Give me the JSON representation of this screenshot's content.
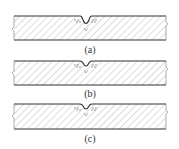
{
  "figure": {
    "panels": [
      {
        "id": "a",
        "label": "(a)",
        "notch": "rounded groove with dashed interface"
      },
      {
        "id": "b",
        "label": "(b)",
        "notch": "shallow rounded groove with dashed interface"
      },
      {
        "id": "c",
        "label": "(c)",
        "notch": "shallow rounded groove with dashed interface"
      }
    ],
    "colors": {
      "line": "#333333",
      "hatch": "#8a8a8a",
      "background": "#ffffff"
    }
  }
}
